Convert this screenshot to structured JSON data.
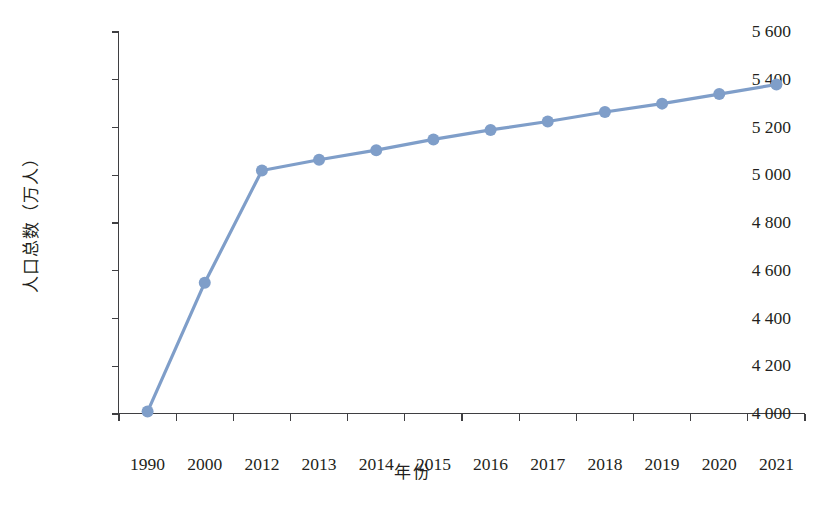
{
  "chart_data": {
    "type": "line",
    "title": "",
    "xlabel": "年份",
    "ylabel": "人口总数（万人）",
    "categories": [
      "1990",
      "2000",
      "2012",
      "2013",
      "2014",
      "2015",
      "2016",
      "2017",
      "2018",
      "2019",
      "2020",
      "2021"
    ],
    "values": [
      4010,
      4550,
      5020,
      5065,
      5105,
      5150,
      5190,
      5225,
      5265,
      5300,
      5340,
      5380
    ],
    "series": [
      {
        "name": "人口总数",
        "values": [
          4010,
          4550,
          5020,
          5065,
          5105,
          5150,
          5190,
          5225,
          5265,
          5300,
          5340,
          5380
        ]
      }
    ],
    "ylim": [
      4000,
      5600
    ],
    "ytick_values": [
      5600,
      5400,
      5200,
      5000,
      4800,
      4600,
      4400,
      4200,
      4000
    ],
    "ytick_labels": [
      "5 600",
      "5 400",
      "5 200",
      "5 000",
      "4 800",
      "4 600",
      "4 400",
      "4 200",
      "4 000"
    ],
    "xtick_labels": [
      "1990",
      "2000",
      "2012",
      "2013",
      "2014",
      "2015",
      "2016",
      "2017",
      "2018",
      "2019",
      "2020",
      "2021"
    ],
    "grid": false,
    "legend": false,
    "legend_position": "none",
    "marker": "circle",
    "marker_radius": 6,
    "line_width": 3.2
  },
  "style": {
    "series_color": "#7f9ec9",
    "axis_color": "#3f3f42",
    "text_color": "#231f20",
    "background": "#ffffff"
  }
}
